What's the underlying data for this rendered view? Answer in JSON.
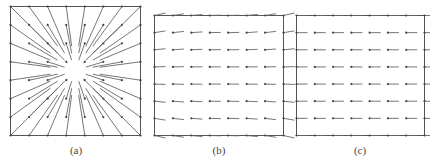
{
  "figure": {
    "colors": {
      "frame": "#555555",
      "vector": "#666666",
      "dot": "#444444",
      "caption": "#444444"
    },
    "panels": [
      {
        "id": "a",
        "caption": "(a)",
        "field": "radial-outward",
        "grid": 8,
        "description": "Vector field radiating outward from the center; dots at grid nodes, lines trailing toward the center"
      },
      {
        "id": "b",
        "caption": "(b)",
        "field": "uniform-left-slight-distortion",
        "grid": 8,
        "description": "Near-uniform horizontal vector field with slight tilt near the corners"
      },
      {
        "id": "c",
        "caption": "(c)",
        "field": "uniform-left",
        "grid": 8,
        "description": "Uniform horizontal vector field"
      }
    ]
  }
}
